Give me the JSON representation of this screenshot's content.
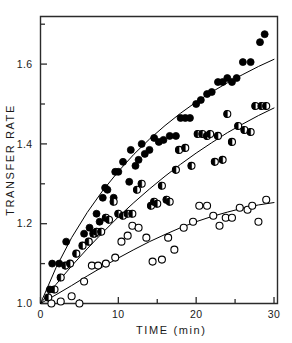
{
  "chart_data": {
    "type": "scatter",
    "title": "",
    "xlabel": "TIME  (min)",
    "ylabel": "TRANSFER  RATE",
    "xlim": [
      0,
      30
    ],
    "ylim": [
      1.0,
      1.72
    ],
    "grid": false,
    "legend_position": "none",
    "x_ticks": [
      0,
      10,
      20,
      30
    ],
    "x_tick_labels": [
      "0",
      "10",
      "20",
      "30"
    ],
    "x_minor_ticks": [
      5,
      15,
      25
    ],
    "y_ticks": [
      1.0,
      1.2,
      1.4,
      1.6
    ],
    "y_tick_labels": [
      "1.0",
      "1.2",
      "1.4",
      "1.6"
    ],
    "y_minor_ticks": [
      1.1,
      1.3,
      1.5,
      1.7
    ],
    "series": [
      {
        "name": "filled-circle-series",
        "marker": "filled-circle",
        "color": "#000000",
        "points": [
          [
            1.2,
            1.035
          ],
          [
            1.5,
            1.1
          ],
          [
            2.4,
            1.1
          ],
          [
            3.3,
            1.155
          ],
          [
            5.6,
            1.175
          ],
          [
            6.3,
            1.19
          ],
          [
            7.0,
            1.175
          ],
          [
            7.2,
            1.225
          ],
          [
            7.6,
            1.205
          ],
          [
            8.0,
            1.265
          ],
          [
            8.3,
            1.29
          ],
          [
            8.6,
            1.285
          ],
          [
            9.4,
            1.265
          ],
          [
            9.6,
            1.33
          ],
          [
            10.0,
            1.33
          ],
          [
            10.6,
            1.355
          ],
          [
            11.4,
            1.305
          ],
          [
            11.6,
            1.385
          ],
          [
            12.2,
            1.345
          ],
          [
            12.6,
            1.36
          ],
          [
            13.0,
            1.4
          ],
          [
            13.4,
            1.375
          ],
          [
            14.0,
            1.385
          ],
          [
            14.6,
            1.415
          ],
          [
            15.2,
            1.405
          ],
          [
            15.8,
            1.41
          ],
          [
            16.6,
            1.42
          ],
          [
            17.4,
            1.42
          ],
          [
            18.0,
            1.465
          ],
          [
            18.6,
            1.465
          ],
          [
            19.2,
            1.465
          ],
          [
            20.0,
            1.5
          ],
          [
            20.6,
            1.51
          ],
          [
            21.4,
            1.525
          ],
          [
            22.0,
            1.53
          ],
          [
            22.8,
            1.555
          ],
          [
            23.4,
            1.555
          ],
          [
            24.0,
            1.565
          ],
          [
            24.6,
            1.555
          ],
          [
            25.2,
            1.565
          ],
          [
            26.0,
            1.605
          ],
          [
            27.0,
            1.605
          ],
          [
            28.2,
            1.655
          ],
          [
            28.8,
            1.675
          ]
        ],
        "fit_curve": [
          [
            0,
            1.0
          ],
          [
            2,
            1.09
          ],
          [
            4,
            1.165
          ],
          [
            6,
            1.228
          ],
          [
            8,
            1.283
          ],
          [
            10,
            1.331
          ],
          [
            12,
            1.374
          ],
          [
            14,
            1.412
          ],
          [
            16,
            1.446
          ],
          [
            18,
            1.477
          ],
          [
            20,
            1.505
          ],
          [
            22,
            1.53
          ],
          [
            24,
            1.553
          ],
          [
            26,
            1.574
          ],
          [
            28,
            1.594
          ],
          [
            30,
            1.612
          ]
        ]
      },
      {
        "name": "half-filled-circle-series",
        "marker": "half-filled-circle",
        "color": "#000000",
        "points": [
          [
            1.0,
            1.015
          ],
          [
            1.8,
            1.035
          ],
          [
            2.6,
            1.065
          ],
          [
            3.2,
            1.095
          ],
          [
            3.8,
            1.1
          ],
          [
            4.6,
            1.125
          ],
          [
            5.4,
            1.145
          ],
          [
            6.2,
            1.155
          ],
          [
            6.8,
            1.175
          ],
          [
            7.2,
            1.18
          ],
          [
            7.8,
            1.18
          ],
          [
            8.4,
            1.215
          ],
          [
            8.8,
            1.21
          ],
          [
            9.4,
            1.255
          ],
          [
            10.0,
            1.225
          ],
          [
            10.6,
            1.22
          ],
          [
            11.2,
            1.225
          ],
          [
            11.8,
            1.225
          ],
          [
            12.4,
            1.285
          ],
          [
            13.0,
            1.3
          ],
          [
            14.2,
            1.245
          ],
          [
            14.6,
            1.255
          ],
          [
            15.0,
            1.25
          ],
          [
            15.6,
            1.295
          ],
          [
            16.2,
            1.26
          ],
          [
            16.6,
            1.255
          ],
          [
            17.4,
            1.335
          ],
          [
            17.8,
            1.385
          ],
          [
            18.6,
            1.39
          ],
          [
            19.4,
            1.345
          ],
          [
            20.2,
            1.425
          ],
          [
            20.8,
            1.425
          ],
          [
            21.4,
            1.42
          ],
          [
            21.8,
            1.425
          ],
          [
            22.4,
            1.355
          ],
          [
            22.8,
            1.42
          ],
          [
            23.4,
            1.36
          ],
          [
            24.0,
            1.475
          ],
          [
            24.6,
            1.405
          ],
          [
            25.4,
            1.445
          ],
          [
            26.2,
            1.435
          ],
          [
            27.0,
            1.43
          ],
          [
            27.6,
            1.495
          ],
          [
            28.4,
            1.495
          ],
          [
            29.0,
            1.495
          ]
        ],
        "fit_curve": [
          [
            0,
            1.0
          ],
          [
            2,
            1.048
          ],
          [
            4,
            1.094
          ],
          [
            6,
            1.137
          ],
          [
            8,
            1.178
          ],
          [
            10,
            1.217
          ],
          [
            12,
            1.253
          ],
          [
            14,
            1.287
          ],
          [
            16,
            1.319
          ],
          [
            18,
            1.349
          ],
          [
            20,
            1.377
          ],
          [
            22,
            1.403
          ],
          [
            24,
            1.428
          ],
          [
            26,
            1.45
          ],
          [
            28,
            1.471
          ],
          [
            30,
            1.49
          ]
        ]
      },
      {
        "name": "open-circle-series",
        "marker": "open-circle",
        "color": "#000000",
        "points": [
          [
            1.4,
            1.0
          ],
          [
            2.6,
            1.005
          ],
          [
            4.0,
            1.018
          ],
          [
            5.0,
            1.0
          ],
          [
            5.6,
            1.055
          ],
          [
            6.6,
            1.095
          ],
          [
            7.4,
            1.095
          ],
          [
            8.4,
            1.1
          ],
          [
            9.6,
            1.115
          ],
          [
            10.4,
            1.155
          ],
          [
            11.2,
            1.17
          ],
          [
            11.8,
            1.195
          ],
          [
            12.6,
            1.19
          ],
          [
            13.6,
            1.165
          ],
          [
            14.4,
            1.105
          ],
          [
            15.6,
            1.11
          ],
          [
            16.4,
            1.165
          ],
          [
            17.2,
            1.135
          ],
          [
            18.4,
            1.19
          ],
          [
            19.6,
            1.205
          ],
          [
            20.4,
            1.245
          ],
          [
            21.4,
            1.245
          ],
          [
            22.2,
            1.22
          ],
          [
            23.0,
            1.195
          ],
          [
            23.8,
            1.215
          ],
          [
            24.6,
            1.215
          ],
          [
            25.6,
            1.24
          ],
          [
            26.6,
            1.235
          ],
          [
            27.2,
            1.245
          ],
          [
            28.0,
            1.205
          ],
          [
            29.0,
            1.26
          ]
        ],
        "fit_curve": [
          [
            0,
            1.0
          ],
          [
            2,
            1.022
          ],
          [
            4,
            1.045
          ],
          [
            6,
            1.069
          ],
          [
            8,
            1.092
          ],
          [
            10,
            1.114
          ],
          [
            12,
            1.135
          ],
          [
            14,
            1.155
          ],
          [
            16,
            1.173
          ],
          [
            18,
            1.19
          ],
          [
            20,
            1.205
          ],
          [
            22,
            1.218
          ],
          [
            24,
            1.229
          ],
          [
            26,
            1.239
          ],
          [
            28,
            1.247
          ],
          [
            30,
            1.253
          ]
        ]
      }
    ]
  }
}
